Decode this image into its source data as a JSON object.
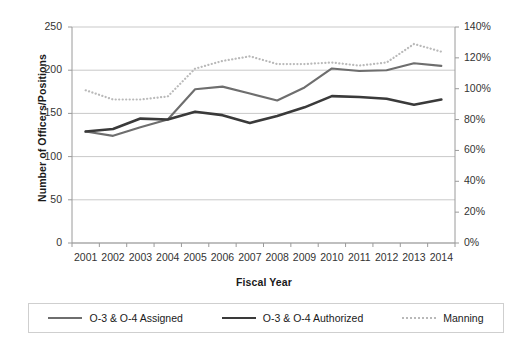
{
  "chart_data": {
    "type": "line",
    "title": "",
    "xlabel": "Fiscal Year",
    "ylabel": "Number of Officers/Positions",
    "y2label": "",
    "categories": [
      "2001",
      "2002",
      "2003",
      "2004",
      "2005",
      "2006",
      "2007",
      "2008",
      "2009",
      "2010",
      "2011",
      "2012",
      "2013",
      "2014"
    ],
    "ylim": [
      0,
      250
    ],
    "yticks": [
      "0",
      "50",
      "100",
      "150",
      "200",
      "250"
    ],
    "y2lim": [
      0,
      140
    ],
    "y2ticks": [
      "0%",
      "20%",
      "40%",
      "60%",
      "80%",
      "100%",
      "120%",
      "140%"
    ],
    "grid": true,
    "legend_position": "bottom",
    "series": [
      {
        "name": "O-3 & O-4 Assigned",
        "axis": "left",
        "style": "solid",
        "color": "#6e6e6e",
        "values": [
          129,
          124,
          134,
          143,
          178,
          181,
          173,
          165,
          180,
          202,
          199,
          200,
          208,
          205
        ]
      },
      {
        "name": "O-3 & O-4 Authorized",
        "axis": "left",
        "style": "solid",
        "color": "#3a3a3a",
        "values": [
          129,
          132,
          144,
          143,
          152,
          148,
          139,
          147,
          157,
          170,
          169,
          167,
          160,
          166
        ]
      },
      {
        "name": "Manning",
        "axis": "right",
        "style": "dotted",
        "color": "#b9b9b9",
        "values": [
          99,
          93,
          93,
          95,
          113,
          118,
          121,
          116,
          116,
          117,
          115,
          117,
          129,
          124
        ]
      }
    ]
  },
  "legend": {
    "items": [
      {
        "label": "O-3 & O-4 Assigned",
        "swatch": "solid-assigned"
      },
      {
        "label": "O-3 & O-4 Authorized",
        "swatch": "solid-authorized"
      },
      {
        "label": "Manning",
        "swatch": "dotted-manning"
      }
    ]
  }
}
